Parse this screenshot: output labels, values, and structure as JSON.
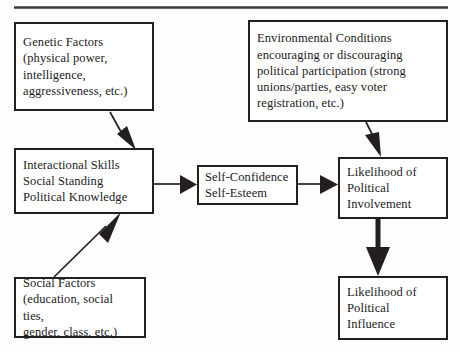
{
  "diagram": {
    "type": "flowchart",
    "line_color": "#231f20",
    "box_fill": "#ffffff",
    "background": "#fdfdfc",
    "top_rule": {
      "visible": true
    },
    "nodes": [
      {
        "id": "genetic",
        "label": "Genetic Factors\n(physical power,\nintelligence,\naggressiveness, etc.)"
      },
      {
        "id": "environmental",
        "label": "Environmental Conditions\nencouraging or discouraging\npolitical participation (strong\nunions/parties, easy voter\nregistration, etc.)"
      },
      {
        "id": "interactional",
        "label": "Interactional Skills\nSocial Standing\nPolitical Knowledge"
      },
      {
        "id": "selfconcept",
        "label": "Self-Confidence\nSelf-Esteem"
      },
      {
        "id": "involvement",
        "label": "Likelihood of\nPolitical\nInvolvement"
      },
      {
        "id": "social",
        "label": "Social Factors\n(education, social ties,\ngender, class, etc.)"
      },
      {
        "id": "influence",
        "label": "Likelihood of\nPolitical\nInfluence"
      }
    ],
    "edges": [
      {
        "id": "genetic-to-interactional",
        "from": "genetic",
        "to": "interactional",
        "style": "diagonal-thin"
      },
      {
        "id": "social-to-interactional",
        "from": "social",
        "to": "interactional",
        "style": "diagonal-thin"
      },
      {
        "id": "interactional-to-selfconcept",
        "from": "interactional",
        "to": "selfconcept",
        "style": "horizontal-thin"
      },
      {
        "id": "selfconcept-to-involvement",
        "from": "selfconcept",
        "to": "involvement",
        "style": "horizontal-thin"
      },
      {
        "id": "environmental-to-involvement",
        "from": "environmental",
        "to": "involvement",
        "style": "diagonal-thin"
      },
      {
        "id": "involvement-to-influence",
        "from": "involvement",
        "to": "influence",
        "style": "vertical-thick"
      }
    ]
  }
}
